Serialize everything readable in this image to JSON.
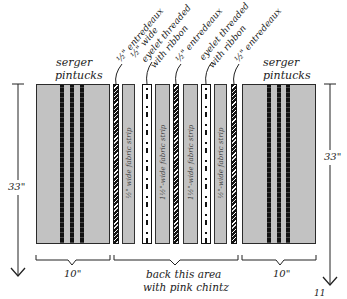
{
  "diagram": {
    "left_panel": {
      "label_line1": "serger",
      "label_line2": "pintucks",
      "width_label": "10\""
    },
    "right_panel": {
      "label_line1": "serger",
      "label_line2": "pintucks",
      "width_label": "10\""
    },
    "height_label_left": "33\"",
    "height_label_right": "33\"",
    "center_note_line1": "back this area",
    "center_note_line2": "with pink chintz",
    "page_number": "11",
    "strips": [
      {
        "type": "entredeaux",
        "callout_line1": "½\" entredeaux",
        "callout_line2": ""
      },
      {
        "type": "fabric",
        "text": "½\" wide fabric strip"
      },
      {
        "type": "eyelet",
        "callout_line1": "½\" wide",
        "callout_line2": "eyelet threaded",
        "callout_line3": "with ribbon"
      },
      {
        "type": "fabric",
        "text": "1½\"-wide fabric strip"
      },
      {
        "type": "entredeaux",
        "callout_line1": "½\" entredeaux"
      },
      {
        "type": "fabric",
        "text": "1½\"-wide fabric strip"
      },
      {
        "type": "eyelet",
        "callout_line1": "eyelet threaded",
        "callout_line2": "with ribbon"
      },
      {
        "type": "fabric",
        "text": "½\"-wide fabric strip"
      },
      {
        "type": "entredeaux",
        "callout_line1": "½\" entredeaux"
      }
    ],
    "colors": {
      "fabric": "#c2c2c2",
      "outline": "#222222",
      "background": "#ffffff"
    }
  }
}
